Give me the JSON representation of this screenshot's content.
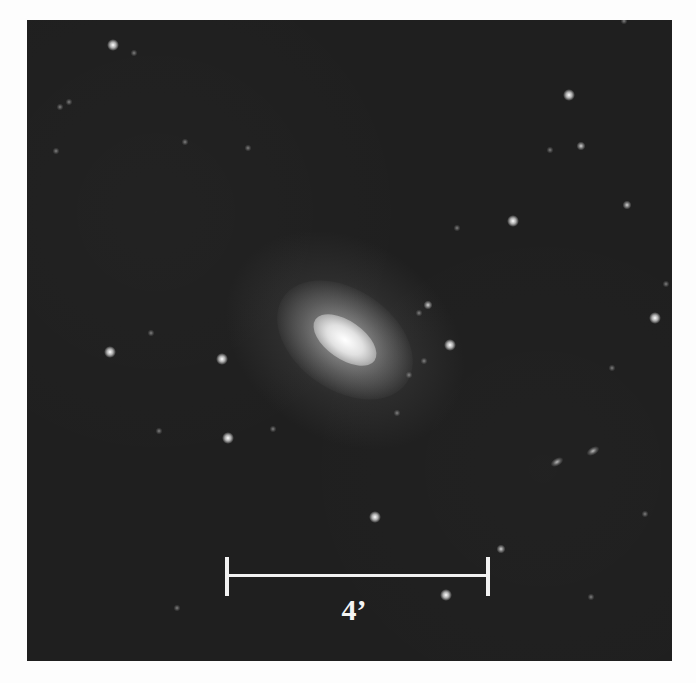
{
  "image": {
    "subject": "elliptical galaxy",
    "background_color": "#1f1f1f",
    "galaxy": {
      "cx": 318,
      "cy": 320,
      "rotation_deg": 35
    }
  },
  "scale_bar": {
    "label": "4’",
    "color": "#f2f2f2"
  },
  "stars": [
    {
      "x": 86,
      "y": 25,
      "size": "bright"
    },
    {
      "x": 107,
      "y": 33,
      "size": "dim"
    },
    {
      "x": 33,
      "y": 87,
      "size": "dim"
    },
    {
      "x": 42,
      "y": 82,
      "size": "dim"
    },
    {
      "x": 29,
      "y": 131,
      "size": "dim"
    },
    {
      "x": 158,
      "y": 122,
      "size": "dim"
    },
    {
      "x": 221,
      "y": 128,
      "size": "dim"
    },
    {
      "x": 597,
      "y": 1,
      "size": "dim"
    },
    {
      "x": 542,
      "y": 75,
      "size": "bright"
    },
    {
      "x": 554,
      "y": 126,
      "size": "medium"
    },
    {
      "x": 523,
      "y": 130,
      "size": "dim"
    },
    {
      "x": 600,
      "y": 185,
      "size": "medium"
    },
    {
      "x": 486,
      "y": 201,
      "size": "bright"
    },
    {
      "x": 430,
      "y": 208,
      "size": "dim"
    },
    {
      "x": 401,
      "y": 285,
      "size": "medium"
    },
    {
      "x": 392,
      "y": 293,
      "size": "dim"
    },
    {
      "x": 628,
      "y": 298,
      "size": "bright"
    },
    {
      "x": 639,
      "y": 264,
      "size": "dim"
    },
    {
      "x": 124,
      "y": 313,
      "size": "dim"
    },
    {
      "x": 83,
      "y": 332,
      "size": "bright"
    },
    {
      "x": 195,
      "y": 339,
      "size": "bright"
    },
    {
      "x": 132,
      "y": 411,
      "size": "dim"
    },
    {
      "x": 201,
      "y": 418,
      "size": "bright"
    },
    {
      "x": 246,
      "y": 409,
      "size": "dim"
    },
    {
      "x": 150,
      "y": 588,
      "size": "dim"
    },
    {
      "x": 423,
      "y": 325,
      "size": "bright"
    },
    {
      "x": 397,
      "y": 341,
      "size": "dim"
    },
    {
      "x": 382,
      "y": 355,
      "size": "dim"
    },
    {
      "x": 370,
      "y": 393,
      "size": "dim"
    },
    {
      "x": 585,
      "y": 348,
      "size": "dim"
    },
    {
      "x": 566,
      "y": 431,
      "size": "elong"
    },
    {
      "x": 530,
      "y": 442,
      "size": "elong"
    },
    {
      "x": 348,
      "y": 497,
      "size": "bright"
    },
    {
      "x": 474,
      "y": 529,
      "size": "medium"
    },
    {
      "x": 419,
      "y": 575,
      "size": "bright"
    },
    {
      "x": 564,
      "y": 577,
      "size": "dim"
    },
    {
      "x": 618,
      "y": 494,
      "size": "dim"
    }
  ]
}
